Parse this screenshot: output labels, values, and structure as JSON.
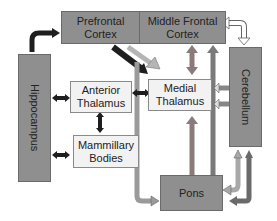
{
  "nodes": {
    "prefrontal_cortex": "Prefrontal\nCortex",
    "middle_frontal_cortex": "Middle Frontal\nCortex",
    "hippocampus": "Hippocampus",
    "anterior_thalamus": "Anterior\nThalamus",
    "medial_thalamus": "Medial\nThalamus",
    "mammillary_bodies": "Mammillary\nBodies",
    "cerebellum": "Cerebellum",
    "pons": "Pons"
  },
  "colors": {
    "dark_box": "#8f8f8f",
    "light_box": "#f2f2f2",
    "black_arrow": "#1e1e1e",
    "gray_arrow": "#9a9a9a",
    "mid_arrow": "#7a7a7a",
    "white_arrow": "#ffffff"
  }
}
